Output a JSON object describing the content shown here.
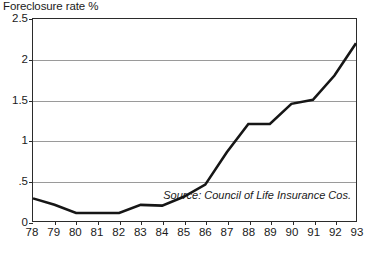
{
  "chart_data": {
    "type": "line",
    "title": "Foreclosure rate %",
    "xlabel": "",
    "ylabel": "",
    "ylim": [
      0,
      2.5
    ],
    "yticks": [
      "0",
      ".5",
      "1",
      "1.5",
      "2",
      "2.5"
    ],
    "ytick_values": [
      0,
      0.5,
      1,
      1.5,
      2,
      2.5
    ],
    "gridlines": [
      0.5,
      1,
      1.5,
      2
    ],
    "grid": true,
    "legend": "none",
    "categories": [
      "78",
      "79",
      "80",
      "81",
      "82",
      "83",
      "84",
      "85",
      "86",
      "87",
      "88",
      "89",
      "90",
      "91",
      "92",
      "93"
    ],
    "x": [
      1978,
      1979,
      1980,
      1981,
      1982,
      1983,
      1984,
      1985,
      1986,
      1987,
      1988,
      1989,
      1990,
      1991,
      1992,
      1993
    ],
    "values": [
      0.28,
      0.2,
      0.1,
      0.1,
      0.1,
      0.2,
      0.19,
      0.3,
      0.45,
      0.85,
      1.2,
      1.2,
      1.45,
      1.5,
      1.8,
      2.2
    ],
    "series": [
      {
        "name": "Foreclosure rate",
        "color": "#161616",
        "values": [
          0.28,
          0.2,
          0.1,
          0.1,
          0.1,
          0.2,
          0.19,
          0.3,
          0.45,
          0.85,
          1.2,
          1.2,
          1.45,
          1.5,
          1.8,
          2.2
        ]
      }
    ],
    "annotations": [
      {
        "text": "Source: Council of Life Insurance Cos.",
        "style": "italic",
        "position": "inside-bottom-right"
      }
    ]
  },
  "figure": {
    "title": "Foreclosure rate %",
    "source_note": "Source: Council of Life Insurance Cos.",
    "bottom_caption": ""
  }
}
